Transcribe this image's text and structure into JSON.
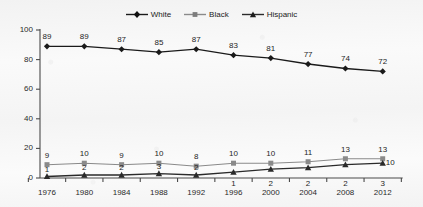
{
  "chart_data": {
    "type": "line",
    "title": "",
    "xlabel": "",
    "ylabel": "",
    "ylim": [
      0,
      100
    ],
    "yticks": [
      0,
      20,
      40,
      60,
      80,
      100
    ],
    "grid": false,
    "legend_position": "top-center",
    "categories": [
      "1976",
      "1980",
      "1984",
      "1988",
      "1992",
      "1996",
      "2000",
      "2004",
      "2008",
      "2012"
    ],
    "series": [
      {
        "name": "White",
        "marker": "diamond",
        "color": "#1a1a1a",
        "values": [
          89,
          89,
          87,
          85,
          87,
          83,
          81,
          77,
          74,
          72
        ],
        "labels": [
          "89",
          "89",
          "87",
          "85",
          "87",
          "83",
          "81",
          "77",
          "74",
          "72"
        ]
      },
      {
        "name": "Black",
        "marker": "square",
        "color": "#8a8a8a",
        "values": [
          9,
          10,
          9,
          10,
          8,
          10,
          10,
          11,
          13,
          13
        ],
        "labels": [
          "9",
          "10",
          "9",
          "10",
          "8",
          "10",
          "10",
          "11",
          "13",
          "13"
        ]
      },
      {
        "name": "Hispanic",
        "marker": "triangle",
        "color": "#2a2a2a",
        "values": [
          1,
          2,
          2,
          3,
          2,
          4,
          6,
          7,
          9,
          10
        ],
        "labels": [
          "1",
          "2",
          "2",
          "3",
          "2",
          "1",
          "2",
          "2",
          "2",
          "3"
        ],
        "end_label": "10"
      }
    ]
  },
  "legend": {
    "items": [
      {
        "label": "White",
        "marker": "diamond-icon"
      },
      {
        "label": "Black",
        "marker": "square-icon"
      },
      {
        "label": "Hispanic",
        "marker": "triangle-icon"
      }
    ]
  },
  "axes": {
    "y_ticks": [
      "100",
      "80",
      "60",
      "40",
      "20",
      "0"
    ],
    "x_ticks": [
      "1976",
      "1980",
      "1984",
      "1988",
      "1992",
      "1996",
      "2000",
      "2004",
      "2008",
      "2012"
    ]
  }
}
